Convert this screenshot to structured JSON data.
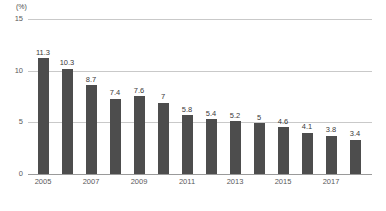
{
  "chart_data": {
    "type": "bar",
    "title": "",
    "subtitle": "",
    "xlabel": "",
    "ylabel": "",
    "unit_label": "(%)",
    "ylim": [
      0,
      15
    ],
    "yticks": [
      0,
      5,
      10,
      15
    ],
    "ytick_labels": [
      "0",
      "5",
      "10",
      "15"
    ],
    "grid": true,
    "gridlines_at": [
      5,
      10,
      15
    ],
    "legend": null,
    "legend_position": "none",
    "bar_color": "#4d4d4d",
    "gridline_color": "#c9c9c9",
    "axis_color": "#9a9a9a",
    "categories": [
      "2005",
      "2006",
      "2007",
      "2008",
      "2009",
      "2010",
      "2011",
      "2012",
      "2013",
      "2014",
      "2015",
      "2016",
      "2017",
      "2018"
    ],
    "values": [
      11.3,
      10.3,
      8.7,
      7.4,
      7.6,
      7,
      5.8,
      5.4,
      5.2,
      5,
      4.6,
      4.1,
      3.8,
      3.4
    ],
    "data_labels": [
      "11.3",
      "10.3",
      "8.7",
      "7.4",
      "7.6",
      "7",
      "5.8",
      "5.4",
      "5.2",
      "5",
      "4.6",
      "4.1",
      "3.8",
      "3.4"
    ],
    "xtick_labels_shown": [
      "2005",
      "2007",
      "2009",
      "2011",
      "2013",
      "2015",
      "2017"
    ],
    "xtick_label_indices": [
      0,
      2,
      4,
      6,
      8,
      10,
      12
    ]
  },
  "footnote": ""
}
